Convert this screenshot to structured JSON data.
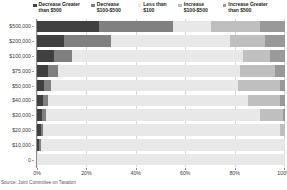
{
  "source_note": "Source: Joint Committee on Taxation",
  "legend": {
    "position": "top",
    "items": [
      {
        "label": "Decrease Greater\nthan $500",
        "color": "#404040",
        "icon": "legend-square-icon"
      },
      {
        "label": "Decrease\n$100-$500",
        "color": "#808080",
        "icon": "legend-square-icon"
      },
      {
        "label": "Less than\n$100",
        "color": "#e8e8e8",
        "icon": "legend-square-icon"
      },
      {
        "label": "Increase\n$100-$500",
        "color": "#bfbfbf",
        "icon": "legend-square-icon"
      },
      {
        "label": "Increase Greater\nthan $500",
        "color": "#999999",
        "icon": "legend-square-icon"
      }
    ]
  },
  "chart_data": {
    "type": "bar",
    "orientation": "horizontal",
    "stacked": true,
    "normalized": true,
    "title": "",
    "subtitle": "",
    "xlabel": "",
    "ylabel": "",
    "xlim": [
      0,
      100
    ],
    "ylim": [
      0,
      10
    ],
    "grid": true,
    "legend_position": "top",
    "x_ticks": [
      "0%",
      "20%",
      "40%",
      "60%",
      "80%",
      "100%"
    ],
    "x_tick_values": [
      0,
      20,
      40,
      60,
      80,
      100
    ],
    "categories": [
      "$500,000",
      "$200,000",
      "$100,000",
      "$75,000",
      "$50,000",
      "$40,000",
      "$30,000",
      "$20,000",
      "$10,000",
      "0"
    ],
    "series": [
      {
        "name": "Decrease Greater than $500",
        "color": "#404040",
        "values": [
          25.0,
          11.0,
          7.0,
          4.5,
          3.0,
          2.5,
          2.0,
          1.5,
          1.0,
          0.0
        ]
      },
      {
        "name": "Decrease $100-$500",
        "color": "#808080",
        "values": [
          30.0,
          19.0,
          7.0,
          4.0,
          2.5,
          2.0,
          1.5,
          1.0,
          0.5,
          0.0
        ]
      },
      {
        "name": "Less than $100",
        "color": "#e8e8e8",
        "values": [
          15.0,
          48.0,
          69.0,
          73.5,
          75.5,
          80.5,
          86.5,
          95.5,
          98.5,
          100.0
        ]
      },
      {
        "name": "Increase $100-$500",
        "color": "#bfbfbf",
        "values": [
          20.0,
          14.0,
          11.0,
          14.0,
          17.0,
          13.0,
          9.0,
          2.0,
          0.0,
          0.0
        ]
      },
      {
        "name": "Increase Greater than $500",
        "color": "#999999",
        "values": [
          10.0,
          8.0,
          6.0,
          4.0,
          2.0,
          2.0,
          1.0,
          0.0,
          0.0,
          0.0
        ]
      }
    ]
  }
}
